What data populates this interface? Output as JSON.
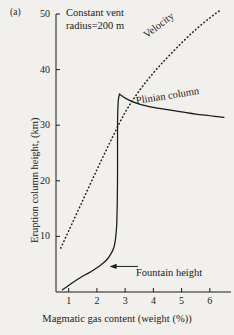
{
  "figure": {
    "panel_label": "(a)",
    "annotation_line1": "Constant vent",
    "annotation_line2": "radius=200 m",
    "velocity_label": "Velocity",
    "plinian_label": "Plinian column",
    "fountain_label": "Fountain height",
    "background_color": "#f2f0ec",
    "ink_color": "#1a1a1a"
  },
  "chart_data": {
    "type": "line",
    "title": "",
    "annotations": [
      "Constant vent",
      "radius=200 m"
    ],
    "xlabel": "Magmatic gas content (weight (%))",
    "ylabel": "Eruption column height, (km)",
    "xlim": [
      0.55,
      6.75
    ],
    "ylim": [
      0,
      50
    ],
    "xticks": [
      1,
      2,
      3,
      4,
      5,
      6
    ],
    "xtick_labels": [
      "1",
      "2",
      "3",
      "4",
      "5",
      "6"
    ],
    "yticks": [
      10,
      20,
      30,
      40,
      50
    ],
    "ytick_labels": [
      "10",
      "20",
      "30",
      "40",
      "50"
    ],
    "grid": false,
    "legend": "none",
    "series": [
      {
        "name": "Fountain height",
        "style": "solid",
        "label_text": "Fountain height",
        "label_x": 3.7,
        "label_y": 4.2,
        "arrow_from_x": 3.45,
        "arrow_from_y": 4.6,
        "arrow_to_x": 2.45,
        "arrow_to_y": 4.6,
        "x": [
          0.78,
          0.95,
          1.2,
          1.45,
          1.7,
          1.95,
          2.15,
          2.35,
          2.5,
          2.6,
          2.66,
          2.7,
          2.72,
          2.73,
          2.73,
          2.73,
          2.74,
          2.76,
          2.8
        ],
        "y": [
          0.4,
          1.0,
          1.9,
          2.7,
          3.4,
          4.2,
          4.9,
          5.8,
          6.9,
          8.0,
          9.6,
          12.0,
          16.0,
          21.0,
          26.0,
          30.0,
          32.6,
          34.6,
          35.6
        ]
      },
      {
        "name": "Plinian column",
        "style": "solid",
        "label_text": "Plinian column",
        "label_x": 3.35,
        "label_y": 34.6,
        "x": [
          2.8,
          3.1,
          3.5,
          4.0,
          4.5,
          5.0,
          5.5,
          6.0,
          6.5
        ],
        "y": [
          35.6,
          34.6,
          33.8,
          33.2,
          32.8,
          32.4,
          32.0,
          31.7,
          31.4
        ]
      },
      {
        "name": "Velocity",
        "style": "dotted",
        "label_text": "Velocity",
        "label_x": 4.1,
        "label_y": 44.5,
        "x": [
          0.72,
          1.0,
          1.5,
          2.0,
          2.5,
          3.0,
          3.5,
          4.0,
          4.5,
          5.0,
          5.5,
          6.0,
          6.4
        ],
        "y": [
          7.9,
          11.0,
          16.5,
          22.0,
          27.3,
          32.3,
          36.2,
          39.4,
          42.2,
          44.8,
          47.2,
          49.3,
          50.8
        ]
      }
    ]
  }
}
